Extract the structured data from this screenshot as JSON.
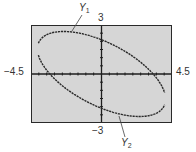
{
  "chart_data": {
    "type": "line",
    "title": "",
    "xlabel": "",
    "ylabel": "",
    "xlim": [
      -4.5,
      4.5
    ],
    "ylim": [
      -3,
      3
    ],
    "xscale_ticks": 0.5,
    "yscale_ticks": 0.5,
    "grid": false,
    "window_labels": {
      "xmin": "−4.5",
      "xmax": "4.5",
      "ymax": "3",
      "ymin": "−3"
    },
    "series": [
      {
        "name": "Y1",
        "description": "upper branch of tilted ellipse",
        "x": [
          -3.7,
          -3.5,
          -3.0,
          -2.5,
          -2.2,
          -1.5,
          -1.0,
          0.0,
          1.0,
          2.0,
          3.0,
          3.3,
          3.6
        ],
        "y": [
          1.9,
          2.25,
          2.5,
          2.6,
          2.6,
          2.55,
          2.45,
          2.1,
          1.6,
          0.9,
          0.2,
          -0.2,
          -0.9
        ]
      },
      {
        "name": "Y2",
        "description": "lower branch of tilted ellipse",
        "x": [
          -3.7,
          -3.3,
          -3.0,
          -2.0,
          -1.0,
          0.0,
          1.0,
          2.0,
          2.5,
          3.0,
          3.5,
          3.7
        ],
        "y": [
          1.3,
          0.2,
          -0.2,
          -0.9,
          -1.6,
          -2.1,
          -2.45,
          -2.6,
          -2.6,
          -2.5,
          -2.2,
          -1.6
        ]
      }
    ],
    "legend": [],
    "annotations": [
      {
        "text": "Y1",
        "points_to": "upper branch near top-left"
      },
      {
        "text": "Y2",
        "points_to": "lower branch near bottom"
      }
    ],
    "equation_model": {
      "A": 0.092,
      "B": 0.171,
      "C": 0.227,
      "form": "A x^2 + B x y + C y^2 = 1"
    }
  },
  "labels": {
    "xmin": "−4.5",
    "xmax": "4.5",
    "ymax": "3",
    "ymin": "−3",
    "y1_main": "Y",
    "y1_sub": "1",
    "y2_main": "Y",
    "y2_sub": "2"
  },
  "colors": {
    "screen_bg": "#d6d6d6",
    "curve": "#2a2a2a",
    "axis": "#1e1e1e",
    "frame": "#2a2a2a"
  }
}
